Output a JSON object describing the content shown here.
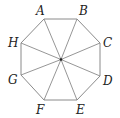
{
  "figure": {
    "type": "regular-octagon",
    "center": {
      "x": 61,
      "y": 59.5
    },
    "vertices": [
      {
        "label": "A",
        "x": 44,
        "y": 19,
        "lx": 36,
        "ly": 15
      },
      {
        "label": "B",
        "x": 77,
        "y": 19,
        "lx": 79,
        "ly": 15
      },
      {
        "label": "C",
        "x": 100,
        "y": 43,
        "lx": 103,
        "ly": 47
      },
      {
        "label": "D",
        "x": 100,
        "y": 76,
        "lx": 103,
        "ly": 85
      },
      {
        "label": "E",
        "x": 77,
        "y": 100,
        "lx": 76,
        "ly": 114
      },
      {
        "label": "F",
        "x": 44,
        "y": 100,
        "lx": 36,
        "ly": 114
      },
      {
        "label": "G",
        "x": 21,
        "y": 75,
        "lx": 8,
        "ly": 84
      },
      {
        "label": "H",
        "x": 21,
        "y": 43,
        "lx": 8,
        "ly": 47
      }
    ],
    "spokes_from_center": true,
    "colors": {
      "line": "#8a8a8a",
      "label": "#222222",
      "center_dot": "#222222"
    }
  }
}
